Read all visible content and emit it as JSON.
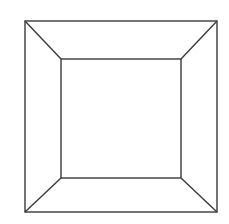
{
  "figure": {
    "canvas": {
      "width": 229,
      "height": 224,
      "background_color": "#ffffff"
    },
    "style": {
      "stroke_color": "#3a3a3a",
      "stroke_width": 1.4,
      "fill_color": "#ffffff"
    },
    "outer_rect": {
      "name": "outer-rectangle",
      "x1": 25,
      "y1": 21,
      "x2": 217,
      "y2": 212,
      "width": 192,
      "height": 191
    },
    "inner_rect": {
      "name": "inner-rectangle",
      "x1": 61,
      "y1": 59,
      "x2": 181,
      "y2": 178,
      "width": 120,
      "height": 119
    },
    "diagonals": [
      {
        "name": "diagonal-top-left",
        "x1": 25,
        "y1": 21,
        "x2": 61,
        "y2": 59
      },
      {
        "name": "diagonal-top-right",
        "x1": 217,
        "y1": 21,
        "x2": 181,
        "y2": 59
      },
      {
        "name": "diagonal-bottom-left",
        "x1": 25,
        "y1": 212,
        "x2": 61,
        "y2": 178
      },
      {
        "name": "diagonal-bottom-right",
        "x1": 217,
        "y1": 212,
        "x2": 181,
        "y2": 178
      }
    ],
    "faces": [
      {
        "name": "face-top",
        "points": "25,21 217,21 181,59 61,59"
      },
      {
        "name": "face-right",
        "points": "217,21 217,212 181,178 181,59"
      },
      {
        "name": "face-bottom",
        "points": "25,212 61,178 181,178 217,212"
      },
      {
        "name": "face-left",
        "points": "25,21 61,59 61,178 25,212"
      },
      {
        "name": "face-back",
        "points": "61,59 181,59 181,178 61,178"
      }
    ]
  }
}
